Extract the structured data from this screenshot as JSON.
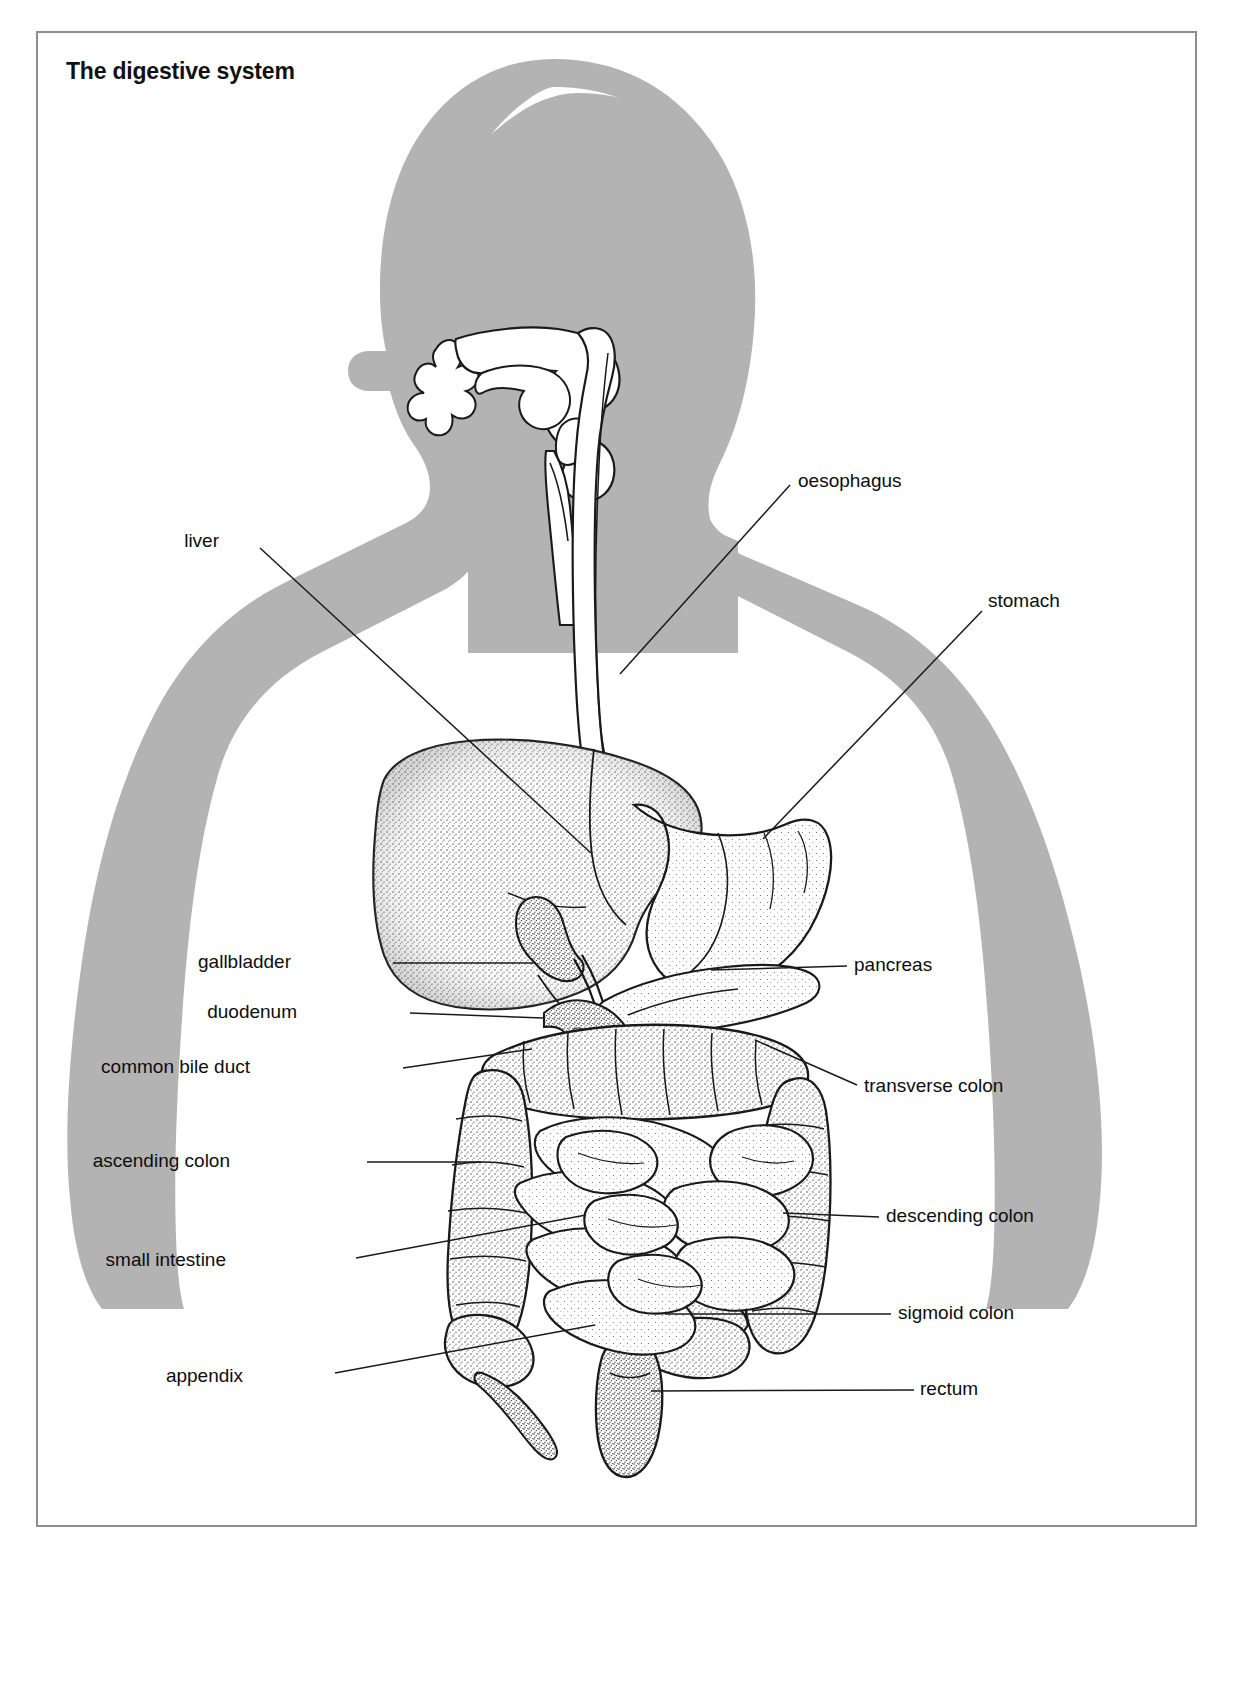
{
  "title": "The digestive system",
  "colors": {
    "body_silhouette": "#b3b3b3",
    "organ_fill": "#ffffff",
    "outline": "#1a1a1a",
    "frame_border": "#8d8d8d",
    "label_text": "#0d0d0d",
    "page_background": "#ffffff"
  },
  "diagram": {
    "type": "anatomical-illustration",
    "view": "anterior torso with head in profile",
    "labels": [
      {
        "id": "oesophagus",
        "text": "oesophagus",
        "side": "right",
        "x": 760,
        "y": 448,
        "leader": [
          [
            752,
            452
          ],
          [
            582,
            641
          ]
        ]
      },
      {
        "id": "liver",
        "text": "liver",
        "side": "left",
        "x": 181,
        "y": 508,
        "leader": [
          [
            222,
            515
          ],
          [
            553,
            820
          ]
        ]
      },
      {
        "id": "stomach",
        "text": "stomach",
        "side": "right",
        "x": 950,
        "y": 568,
        "leader": [
          [
            944,
            578
          ],
          [
            725,
            806
          ]
        ]
      },
      {
        "id": "gallbladder",
        "text": "gallbladder",
        "side": "left",
        "x": 253,
        "y": 929,
        "leader": [
          [
            355,
            930
          ],
          [
            497,
            930
          ]
        ]
      },
      {
        "id": "duodenum",
        "text": "duodenum",
        "side": "left",
        "x": 259,
        "y": 979,
        "leader": [
          [
            372,
            980
          ],
          [
            505,
            985
          ]
        ]
      },
      {
        "id": "common-bile-duct",
        "text": "common bile duct",
        "side": "left",
        "x": 212,
        "y": 1034,
        "leader": [
          [
            365,
            1035
          ],
          [
            494,
            1016
          ]
        ]
      },
      {
        "id": "pancreas",
        "text": "pancreas",
        "side": "right",
        "x": 816,
        "y": 932,
        "leader": [
          [
            809,
            933
          ],
          [
            673,
            937
          ]
        ]
      },
      {
        "id": "transverse-colon",
        "text": "transverse colon",
        "side": "right",
        "x": 826,
        "y": 1053,
        "leader": [
          [
            819,
            1052
          ],
          [
            717,
            1007
          ]
        ]
      },
      {
        "id": "ascending-colon",
        "text": "ascending colon",
        "side": "left",
        "x": 192,
        "y": 1128,
        "leader": [
          [
            329,
            1129
          ],
          [
            443,
            1129
          ]
        ]
      },
      {
        "id": "descending-colon",
        "text": "descending colon",
        "side": "right",
        "x": 848,
        "y": 1183,
        "leader": [
          [
            841,
            1184
          ],
          [
            745,
            1180
          ]
        ]
      },
      {
        "id": "small-intestine",
        "text": "small intestine",
        "side": "left",
        "x": 188,
        "y": 1227,
        "leader": [
          [
            318,
            1225
          ],
          [
            548,
            1182
          ]
        ]
      },
      {
        "id": "sigmoid-colon",
        "text": "sigmoid colon",
        "side": "right",
        "x": 860,
        "y": 1280,
        "leader": [
          [
            853,
            1281
          ],
          [
            627,
            1281
          ]
        ]
      },
      {
        "id": "appendix",
        "text": "appendix",
        "side": "left",
        "x": 205,
        "y": 1343,
        "leader": [
          [
            297,
            1340
          ],
          [
            557,
            1292
          ]
        ]
      },
      {
        "id": "rectum",
        "text": "rectum",
        "side": "right",
        "x": 882,
        "y": 1356,
        "leader": [
          [
            876,
            1357
          ],
          [
            613,
            1358
          ]
        ]
      }
    ],
    "structures": [
      "nasal cavity",
      "oral cavity",
      "tongue",
      "pharynx",
      "epiglottis",
      "larynx",
      "trachea",
      "oesophagus",
      "stomach",
      "liver",
      "gallbladder",
      "common bile duct",
      "duodenum",
      "pancreas",
      "small intestine",
      "ascending colon",
      "transverse colon",
      "descending colon",
      "sigmoid colon",
      "appendix",
      "rectum"
    ]
  }
}
